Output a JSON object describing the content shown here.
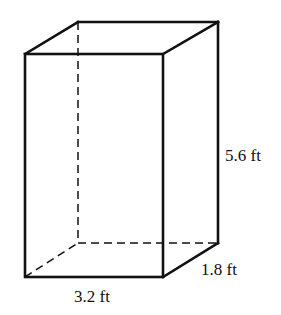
{
  "figure": {
    "type": "rectangular-prism",
    "dimensions": {
      "height": "5.6 ft",
      "depth": "1.8 ft",
      "width": "3.2 ft"
    }
  },
  "labels": {
    "height_label": "5.6 ft",
    "depth_label": "1.8 ft",
    "width_label": "3.2 ft"
  }
}
